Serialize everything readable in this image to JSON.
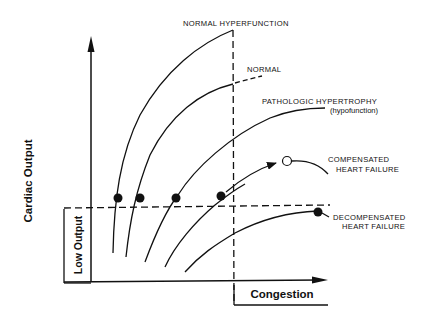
{
  "diagram": {
    "axes": {
      "y_label": "Cardiac Output",
      "x_label": "Congestion",
      "low_output_label": "Low Output"
    },
    "curves": [
      {
        "name": "Normal Hyperfunction",
        "label": "NORMAL HYPERFUNCTION",
        "point": "filled"
      },
      {
        "name": "Normal",
        "label": "NORMAL",
        "point": "filled"
      },
      {
        "name": "Pathologic Hypertrophy",
        "label": "PATHOLOGIC HYPERTROPHY",
        "sublabel": "(hypofunction)",
        "point": "filled"
      },
      {
        "name": "Compensated Heart Failure",
        "label_line1": "COMPENSATED",
        "label_line2": "HEART FAILURE",
        "point": "open"
      },
      {
        "name": "Decompensated Heart Failure",
        "label_line1": "DECOMPENSATED",
        "label_line2": "HEART FAILURE",
        "point": "filled"
      }
    ],
    "thresholds": {
      "low_output": "horizontal dashed line",
      "congestion": "vertical dashed line"
    },
    "colors": {
      "ink": "#111111",
      "background": "#ffffff"
    }
  }
}
